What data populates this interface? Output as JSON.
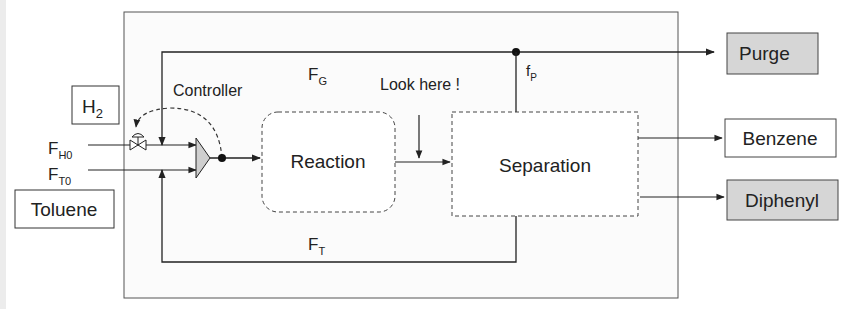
{
  "diagram": {
    "title": "",
    "inputs": {
      "hydrogen": {
        "label": "H",
        "subscript": "2"
      },
      "toluene": {
        "label": "Toluene"
      }
    },
    "streams": {
      "fh0": {
        "main": "F",
        "sub": "H0"
      },
      "ft0": {
        "main": "F",
        "sub": "T0"
      },
      "fg": {
        "main": "F",
        "sub": "G"
      },
      "ft": {
        "main": "F",
        "sub": "T"
      },
      "fp": {
        "main": "f",
        "sub": "P"
      }
    },
    "units": {
      "reaction": "Reaction",
      "separation": "Separation"
    },
    "outputs": {
      "purge": "Purge",
      "benzene": "Benzene",
      "diphenyl": "Diphenyl"
    },
    "annotations": {
      "controller": "Controller",
      "look_here": "Look here !"
    },
    "colors": {
      "line": "#222222",
      "shaded_box": "#d6d6d6",
      "mixer_fill": "#cfcfcf",
      "frame": "#555555"
    }
  }
}
